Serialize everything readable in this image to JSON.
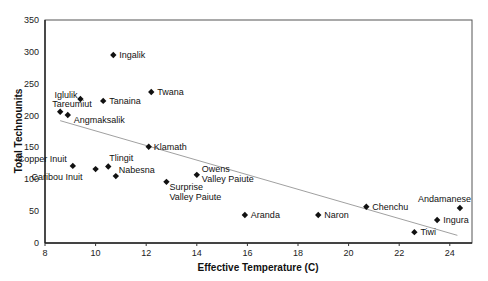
{
  "chart_data": {
    "type": "scatter",
    "title": "",
    "xlabel": "Effective Temperature (C)",
    "ylabel": "Total Technounits",
    "xlim": [
      8,
      25
    ],
    "ylim": [
      0,
      350
    ],
    "xticks": [
      8,
      10,
      12,
      14,
      16,
      18,
      20,
      22,
      24
    ],
    "yticks": [
      0,
      50,
      100,
      150,
      200,
      250,
      300,
      350
    ],
    "grid": false,
    "legend": null,
    "points": [
      {
        "label": "Ingalik",
        "x": 10.7,
        "y": 295,
        "lx": 6,
        "ly": 3
      },
      {
        "label": "Twana",
        "x": 12.2,
        "y": 237,
        "lx": 6,
        "ly": 3
      },
      {
        "label": "Iglulik",
        "x": 9.4,
        "y": 226,
        "lx": -26,
        "ly": -1
      },
      {
        "label": "Tanaina",
        "x": 10.3,
        "y": 223,
        "lx": 6,
        "ly": 3
      },
      {
        "label": "Tareumiut",
        "x": 8.6,
        "y": 206,
        "lx": -8,
        "ly": -5
      },
      {
        "label": "Angmaksalik",
        "x": 8.9,
        "y": 201,
        "lx": 6,
        "ly": 8
      },
      {
        "label": "Klamath",
        "x": 12.1,
        "y": 151,
        "lx": 5,
        "ly": 3
      },
      {
        "label": "Tlingit",
        "x": 10.5,
        "y": 120,
        "lx": 1,
        "ly": -6
      },
      {
        "label": "Copper Inuit",
        "x": 9.1,
        "y": 121,
        "lx": -55,
        "ly": -4
      },
      {
        "label": "Caribou Inuit",
        "x": 10.0,
        "y": 116,
        "lx": -64,
        "ly": 11
      },
      {
        "label": "Nabesna",
        "x": 10.8,
        "y": 105,
        "lx": 3,
        "ly": -3
      },
      {
        "label": "Owens Valley Paiute",
        "lines": [
          "Owens",
          "Valley Paiute"
        ],
        "x": 14.0,
        "y": 107,
        "lx": 5,
        "ly": -3
      },
      {
        "label": "Surprise Valley Paiute",
        "lines": [
          "Surprise",
          "Valley Paiute"
        ],
        "x": 12.8,
        "y": 96,
        "lx": 3,
        "ly": 8
      },
      {
        "label": "Aranda",
        "x": 15.9,
        "y": 44,
        "lx": 6,
        "ly": 3
      },
      {
        "label": "Naron",
        "x": 18.8,
        "y": 44,
        "lx": 6,
        "ly": 3
      },
      {
        "label": "Chenchu",
        "x": 20.7,
        "y": 57,
        "lx": 6,
        "ly": 3
      },
      {
        "label": "Tiwi",
        "x": 22.6,
        "y": 17,
        "lx": 6,
        "ly": 3
      },
      {
        "label": "Ingura",
        "x": 23.5,
        "y": 36,
        "lx": 6,
        "ly": 3
      },
      {
        "label": "Andamanese",
        "x": 24.4,
        "y": 55,
        "lx": -42,
        "ly": -6
      }
    ],
    "trendline": {
      "type": "linear",
      "x0": 8.6,
      "y0": 192,
      "x1": 24.3,
      "y1": 12
    }
  }
}
